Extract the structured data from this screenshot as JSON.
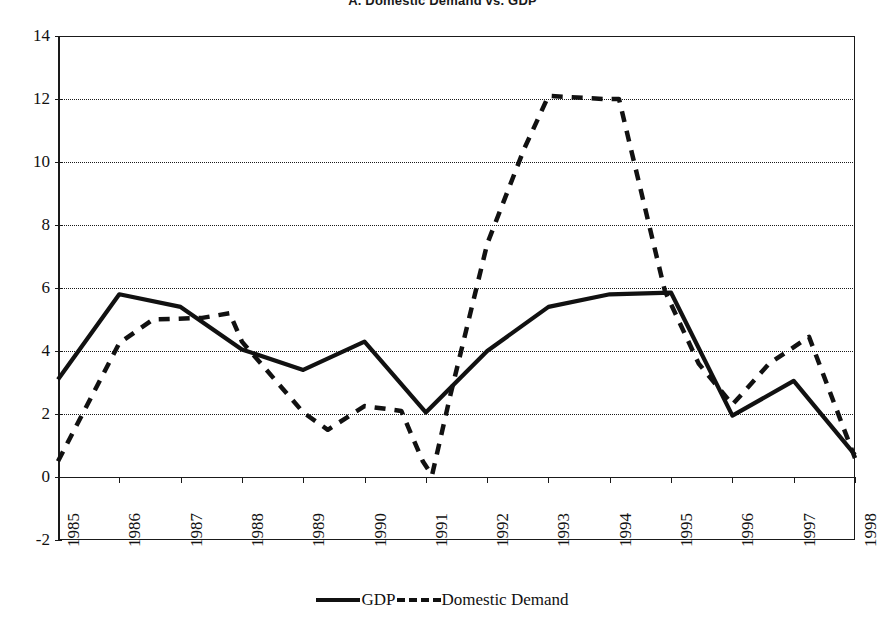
{
  "chart_data": {
    "type": "line",
    "title": "A. Domestic Demand vs. GDP",
    "xlabel": "",
    "ylabel": "",
    "categories": [
      "1985",
      "1986",
      "1987",
      "1988",
      "1989",
      "1990",
      "1991",
      "1992",
      "1993",
      "1994",
      "1995",
      "1996",
      "1997",
      "1998"
    ],
    "ylim": [
      -2,
      14
    ],
    "yticks": [
      -2,
      0,
      2,
      4,
      6,
      8,
      10,
      12,
      14
    ],
    "ytick_labels": [
      "-2",
      "0",
      "2",
      "4",
      "6",
      "8",
      "10",
      "12",
      "14"
    ],
    "grid": "horizontal-dotted",
    "legend_position": "bottom-center",
    "series": [
      {
        "name": "GDP",
        "style": "solid",
        "color": "#111111",
        "values": [
          3.1,
          5.8,
          5.4,
          4.05,
          3.4,
          4.3,
          2.05,
          4.0,
          5.4,
          5.8,
          5.85,
          1.95,
          3.05,
          0.7
        ]
      },
      {
        "name": "Domestic Demand",
        "style": "dashed",
        "color": "#111111",
        "values": [
          0.5,
          4.25,
          4.9,
          5.2,
          2.05,
          2.25,
          0.5,
          7.4,
          12.1,
          12.0,
          5.7,
          2.3,
          3.9,
          0.6
        ]
      }
    ],
    "series_extra_points": {
      "Domestic Demand": [
        {
          "x": 0.0,
          "y": 0.5
        },
        {
          "x": 1.0,
          "y": 4.25
        },
        {
          "x": 1.55,
          "y": 5.0
        },
        {
          "x": 2.35,
          "y": 5.05
        },
        {
          "x": 2.8,
          "y": 5.2
        },
        {
          "x": 3.0,
          "y": 4.3
        },
        {
          "x": 3.6,
          "y": 2.95
        },
        {
          "x": 4.0,
          "y": 2.05
        },
        {
          "x": 4.4,
          "y": 1.5
        },
        {
          "x": 5.0,
          "y": 2.25
        },
        {
          "x": 5.6,
          "y": 2.1
        },
        {
          "x": 5.95,
          "y": 0.5
        },
        {
          "x": 6.1,
          "y": 0.05
        },
        {
          "x": 6.4,
          "y": 2.6
        },
        {
          "x": 7.0,
          "y": 7.4
        },
        {
          "x": 7.6,
          "y": 10.4
        },
        {
          "x": 8.0,
          "y": 12.1
        },
        {
          "x": 8.9,
          "y": 12.0
        },
        {
          "x": 9.15,
          "y": 12.0
        },
        {
          "x": 9.9,
          "y": 5.9
        },
        {
          "x": 10.45,
          "y": 3.6
        },
        {
          "x": 11.0,
          "y": 2.3
        },
        {
          "x": 11.6,
          "y": 3.6
        },
        {
          "x": 12.25,
          "y": 4.45
        },
        {
          "x": 13.0,
          "y": 0.6
        }
      ]
    }
  },
  "legend": {
    "gdp_label": "GDP",
    "domestic_demand_label": "Domestic Demand"
  }
}
